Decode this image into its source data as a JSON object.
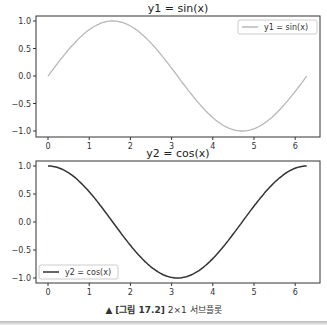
{
  "chart_data": [
    {
      "type": "line",
      "title": "y1 = sin(x)",
      "xlabel": "",
      "ylabel": "",
      "x_range": [
        0,
        6.28
      ],
      "xlim": [
        -0.3,
        6.6
      ],
      "ylim": [
        -1.1,
        1.1
      ],
      "xticks": [
        "0",
        "1",
        "2",
        "3",
        "4",
        "5",
        "6"
      ],
      "yticks": [
        "1.0",
        "0.5",
        "0.0",
        "−0.5",
        "−1.0"
      ],
      "grid": false,
      "legend_position": "upper right",
      "series": [
        {
          "name": "y1 = sin(x)",
          "function": "sin",
          "color": "#b8b8b8",
          "x": [
            0,
            0.5,
            1,
            1.5,
            2,
            2.5,
            3,
            3.5,
            4,
            4.5,
            5,
            5.5,
            6,
            6.28
          ],
          "values": [
            0,
            0.48,
            0.84,
            1.0,
            0.91,
            0.6,
            0.14,
            -0.35,
            -0.76,
            -0.98,
            -0.96,
            -0.71,
            -0.28,
            0
          ]
        }
      ]
    },
    {
      "type": "line",
      "title": "y2 = cos(x)",
      "xlabel": "",
      "ylabel": "",
      "x_range": [
        0,
        6.28
      ],
      "xlim": [
        -0.3,
        6.6
      ],
      "ylim": [
        -1.1,
        1.1
      ],
      "xticks": [
        "0",
        "1",
        "2",
        "3",
        "4",
        "5",
        "6"
      ],
      "yticks": [
        "1.0",
        "0.5",
        "0.0",
        "−0.5",
        "−1.0"
      ],
      "grid": false,
      "legend_position": "lower left",
      "series": [
        {
          "name": "y2 = cos(x)",
          "function": "cos",
          "color": "#333333",
          "x": [
            0,
            0.5,
            1,
            1.5,
            2,
            2.5,
            3,
            3.5,
            4,
            4.5,
            5,
            5.5,
            6,
            6.28
          ],
          "values": [
            1.0,
            0.88,
            0.54,
            0.07,
            -0.42,
            -0.8,
            -0.99,
            -0.94,
            -0.65,
            -0.21,
            0.28,
            0.71,
            0.96,
            1.0
          ]
        }
      ]
    }
  ],
  "caption": {
    "marker": "▲",
    "label": "[그림 17.2]",
    "text": " 2×1 서브플롯"
  }
}
